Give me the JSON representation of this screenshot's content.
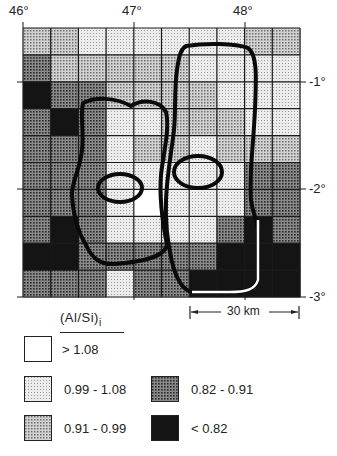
{
  "map": {
    "grid": {
      "left": 23,
      "top": 28,
      "right": 300,
      "bottom": 297,
      "cols": 10,
      "rows": 10,
      "cells": [
        [
          "B",
          "B",
          "A",
          "A",
          "A",
          "A",
          "A",
          "A",
          "B",
          "B"
        ],
        [
          "C",
          "B",
          "B",
          "B",
          "B",
          "B",
          "A",
          "A",
          "A",
          "A"
        ],
        [
          "D",
          "C",
          "C",
          "B",
          "B",
          "B",
          "B",
          "A",
          "A",
          "A"
        ],
        [
          "C",
          "D",
          "C",
          "A",
          "A",
          "B",
          "B",
          "B",
          "A",
          "A"
        ],
        [
          "C",
          "C",
          "C",
          "A",
          "B",
          "B",
          "A",
          "B",
          "B",
          "B"
        ],
        [
          "C",
          "C",
          "C",
          "A",
          "A",
          "A",
          "A",
          "A",
          "C",
          "C"
        ],
        [
          "C",
          "C",
          "C",
          "A",
          "W",
          "A",
          "A",
          "A",
          "C",
          "C"
        ],
        [
          "C",
          "D",
          "C",
          "A",
          "A",
          "A",
          "A",
          "C",
          "D",
          "C"
        ],
        [
          "D",
          "D",
          "C",
          "C",
          "C",
          "C",
          "C",
          "D",
          "D",
          "D"
        ],
        [
          "C",
          "C",
          "C",
          "A",
          "C",
          "C",
          "D",
          "D",
          "D",
          "D"
        ]
      ]
    },
    "longitude_labels": [
      {
        "text": "46°",
        "x": 23
      },
      {
        "text": "47°",
        "x": 134
      },
      {
        "text": "48°",
        "x": 245
      }
    ],
    "latitude_labels": [
      {
        "text": "-1°",
        "y": 82
      },
      {
        "text": "-2°",
        "y": 189
      },
      {
        "text": "-3°",
        "y": 297
      }
    ],
    "scale_bar": {
      "label": "30 km"
    }
  },
  "legend": {
    "title": "(Al/Si)",
    "title_subscript": "i",
    "classes": [
      {
        "key": "W",
        "label": "> 1.08",
        "color": "#ffffff"
      },
      {
        "key": "A",
        "label": "0.99 - 1.08",
        "color": "#e4e4e4"
      },
      {
        "key": "B",
        "label": "0.91 - 0.99",
        "color": "#c4c4c4"
      },
      {
        "key": "C",
        "label": "0.82 - 0.91",
        "color": "#7a7a7a"
      },
      {
        "key": "D",
        "label": "< 0.82",
        "color": "#141414"
      }
    ]
  },
  "chart_data": {
    "type": "heatmap",
    "title": "(Al/Si)i",
    "xlabel": "Longitude",
    "ylabel": "Latitude",
    "x_ticks": [
      "46°",
      "47°",
      "48°"
    ],
    "y_ticks": [
      "-1°",
      "-2°",
      "-3°"
    ],
    "legend": [
      "> 1.08",
      "0.99 - 1.08",
      "0.91 - 0.99",
      "0.82 - 0.91",
      "< 0.82"
    ],
    "scale": "30 km"
  }
}
